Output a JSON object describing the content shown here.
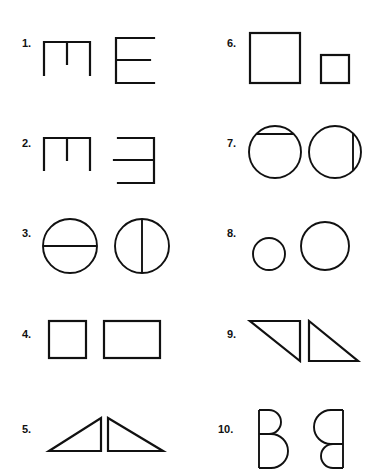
{
  "page": {
    "background_color": "#ffffff",
    "ink_color": "#111111",
    "width": 380,
    "height": 476
  },
  "items": [
    {
      "number": "1.",
      "number_x": 22,
      "number_y": 38,
      "column": "left",
      "figures": [
        {
          "name": "m-shape",
          "description": "Top bar with three downward legs, middle leg shorter"
        },
        {
          "name": "letter-e",
          "description": "Vertical stem on left with three horizontal bars"
        }
      ]
    },
    {
      "number": "2.",
      "number_x": 22,
      "number_y": 138,
      "column": "left",
      "figures": [
        {
          "name": "m-shape",
          "description": "Top bar with three downward legs, middle leg shorter"
        },
        {
          "name": "reversed-letter-e",
          "description": "Vertical stem on right with three horizontal bars extending left"
        }
      ]
    },
    {
      "number": "3.",
      "number_x": 22,
      "number_y": 228,
      "column": "left",
      "figures": [
        {
          "name": "circle-horizontal-diameter",
          "description": "Circle split by a horizontal diameter"
        },
        {
          "name": "circle-vertical-diameter",
          "description": "Circle split by a vertical diameter"
        }
      ]
    },
    {
      "number": "4.",
      "number_x": 22,
      "number_y": 329,
      "column": "left",
      "figures": [
        {
          "name": "square",
          "description": "Square"
        },
        {
          "name": "rectangle",
          "description": "Wide rectangle"
        }
      ]
    },
    {
      "number": "5.",
      "number_x": 22,
      "number_y": 424,
      "column": "left",
      "figures": [
        {
          "name": "right-triangle-bottom-right",
          "description": "Right triangle with right angle at bottom right"
        },
        {
          "name": "right-triangle-bottom-left",
          "description": "Right triangle with right angle at bottom left"
        }
      ]
    },
    {
      "number": "6.",
      "number_x": 227,
      "number_y": 38,
      "column": "right",
      "figures": [
        {
          "name": "large-square",
          "description": "Large square"
        },
        {
          "name": "small-square",
          "description": "Small square"
        }
      ]
    },
    {
      "number": "7.",
      "number_x": 227,
      "number_y": 138,
      "column": "right",
      "figures": [
        {
          "name": "circle-horizontal-chord",
          "description": "Circle with a horizontal chord near the top"
        },
        {
          "name": "circle-vertical-chord",
          "description": "Circle with a vertical chord near the right"
        }
      ]
    },
    {
      "number": "8.",
      "number_x": 227,
      "number_y": 228,
      "column": "right",
      "figures": [
        {
          "name": "small-circle",
          "description": "Small circle"
        },
        {
          "name": "large-circle",
          "description": "Large circle"
        }
      ]
    },
    {
      "number": "9.",
      "number_x": 227,
      "number_y": 329,
      "column": "right",
      "figures": [
        {
          "name": "right-triangle-top-right",
          "description": "Right triangle with right angle at top right"
        },
        {
          "name": "right-triangle-top-left",
          "description": "Right triangle with right angle at top left"
        }
      ]
    },
    {
      "number": "10.",
      "number_x": 218,
      "number_y": 424,
      "column": "right",
      "figures": [
        {
          "name": "letter-b-small-top-bowl",
          "description": "B shape, stem on left, small top bowl and large bottom bowl"
        },
        {
          "name": "letter-b-large-top-bowl-mirrored",
          "description": "Mirrored B shape, stem on right, large top bowl and small bottom bowl"
        }
      ]
    }
  ]
}
